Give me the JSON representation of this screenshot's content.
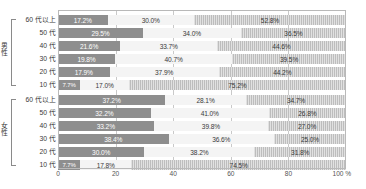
{
  "chart_data": {
    "type": "bar",
    "subtype": "stacked-horizontal-100",
    "title": "",
    "xlabel": "",
    "ylabel": "",
    "xlim": [
      0,
      100
    ],
    "xticks": [
      0,
      20,
      40,
      60,
      80,
      100
    ],
    "xtick_labels": [
      "0",
      "20",
      "40",
      "60",
      "80",
      "100 %"
    ],
    "unit_suffix": "%",
    "grid": true,
    "legend": "none",
    "series": [
      {
        "name": "segment-1",
        "color": "#8e8e8e"
      },
      {
        "name": "segment-2",
        "color": "#f4f4f4"
      },
      {
        "name": "segment-3",
        "color": "#bdbdbd"
      }
    ],
    "groups": [
      {
        "name": "男性",
        "categories": [
          "60 代以上",
          "50 代",
          "40 代",
          "30 代",
          "20 代",
          "10 代"
        ],
        "rows": [
          {
            "category": "60 代以上",
            "values": [
              17.2,
              30.0,
              52.8
            ],
            "labels": [
              "17.2%",
              "30.0%",
              "52.8%"
            ]
          },
          {
            "category": "50 代",
            "values": [
              29.5,
              34.0,
              36.5
            ],
            "labels": [
              "29.5%",
              "34.0%",
              "36.5%"
            ]
          },
          {
            "category": "40 代",
            "values": [
              21.6,
              33.7,
              44.6
            ],
            "labels": [
              "21.6%",
              "33.7%",
              "44.6%"
            ]
          },
          {
            "category": "30 代",
            "values": [
              19.8,
              40.7,
              39.5
            ],
            "labels": [
              "19.8%",
              "40.7%",
              "39.5%"
            ]
          },
          {
            "category": "20 代",
            "values": [
              17.9,
              37.9,
              44.2
            ],
            "labels": [
              "17.9%",
              "37.9%",
              "44.2%"
            ]
          },
          {
            "category": "10 代",
            "values": [
              7.7,
              17.0,
              75.2
            ],
            "labels": [
              "7.7%",
              "17.0%",
              "75.2%"
            ]
          }
        ]
      },
      {
        "name": "女性",
        "categories": [
          "60 代以上",
          "50 代",
          "40 代",
          "30 代",
          "20 代",
          "10 代"
        ],
        "rows": [
          {
            "category": "60 代以上",
            "values": [
              37.2,
              28.1,
              34.7
            ],
            "labels": [
              "37.2%",
              "28.1%",
              "34.7%"
            ]
          },
          {
            "category": "50 代",
            "values": [
              32.2,
              41.0,
              26.8
            ],
            "labels": [
              "32.2%",
              "41.0%",
              "26.8%"
            ]
          },
          {
            "category": "40 代",
            "values": [
              33.2,
              39.8,
              27.0
            ],
            "labels": [
              "33.2%",
              "39.8%",
              "27.0%"
            ]
          },
          {
            "category": "30 代",
            "values": [
              38.4,
              36.6,
              25.0
            ],
            "labels": [
              "38.4%",
              "36.6%",
              "25.0%"
            ]
          },
          {
            "category": "20 代",
            "values": [
              30.0,
              38.2,
              31.8
            ],
            "labels": [
              "30.0%",
              "38.2%",
              "31.8%"
            ]
          },
          {
            "category": "10 代",
            "values": [
              7.7,
              17.8,
              74.5
            ],
            "labels": [
              "7.7%",
              "17.8%",
              "74.5%"
            ]
          }
        ]
      }
    ]
  }
}
